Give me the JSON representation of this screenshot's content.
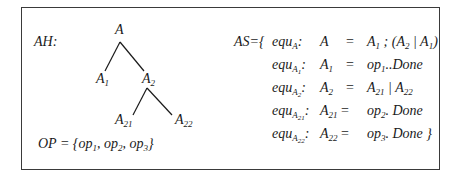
{
  "diagram": {
    "ah_label": "AH:",
    "tree": {
      "nodes": [
        {
          "id": "A",
          "base": "A",
          "sub": ""
        },
        {
          "id": "A1",
          "base": "A",
          "sub": "1"
        },
        {
          "id": "A2",
          "base": "A",
          "sub": "2"
        },
        {
          "id": "A21",
          "base": "A",
          "sub": "21"
        },
        {
          "id": "A22",
          "base": "A",
          "sub": "22"
        }
      ],
      "edges": [
        [
          "A",
          "A1"
        ],
        [
          "A",
          "A2"
        ],
        [
          "A2",
          "A21"
        ],
        [
          "A2",
          "A22"
        ]
      ]
    },
    "op_set": {
      "prefix": "OP = {",
      "items": [
        {
          "base": "op",
          "sub": "1"
        },
        {
          "base": "op",
          "sub": "2"
        },
        {
          "base": "op",
          "sub": "3"
        }
      ],
      "suffix": "}"
    },
    "as_label": "AS={",
    "equations": [
      {
        "name_base": "equ",
        "name_sub": "A",
        "name_subsub": "",
        "lhs_base": "A",
        "lhs_sub": "",
        "eq": "=",
        "rhs": "A1 ; (A2 | A1)"
      },
      {
        "name_base": "equ",
        "name_sub": "A",
        "name_subsub": "1",
        "lhs_base": "A",
        "lhs_sub": "1",
        "eq": "=",
        "rhs": "op1..Done"
      },
      {
        "name_base": "equ",
        "name_sub": "A",
        "name_subsub": "2",
        "lhs_base": "A",
        "lhs_sub": "2",
        "eq": "=",
        "rhs": "A21 | A22"
      },
      {
        "name_base": "equ",
        "name_sub": "A",
        "name_subsub": "21",
        "lhs_base": "A",
        "lhs_sub": "21",
        "eq": "=",
        "rhs": "op2. Done"
      },
      {
        "name_base": "equ",
        "name_sub": "A",
        "name_subsub": "22",
        "lhs_base": "A",
        "lhs_sub": "22",
        "eq": "=",
        "rhs": "op3. Done }"
      }
    ]
  }
}
